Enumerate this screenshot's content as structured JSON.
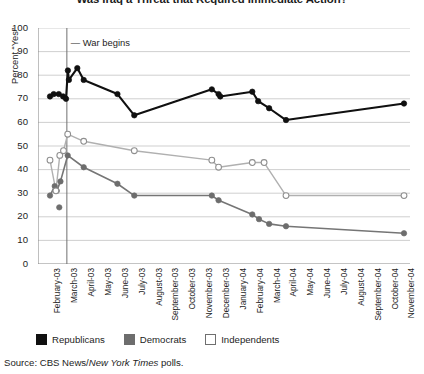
{
  "title": "Was Iraq a Threat that Required Immediate Action?",
  "source": {
    "prefix": "Source: CBS News/",
    "italic": "New York Times",
    "suffix": " polls."
  },
  "annotation": {
    "war_begins": "War begins",
    "war_begins_month": "March-03"
  },
  "axes": {
    "ylabel": "Percent “Yes”",
    "xlabel": "",
    "yticks": [
      0,
      10,
      20,
      30,
      40,
      50,
      60,
      70,
      80,
      90,
      100
    ],
    "ylim": [
      0,
      100
    ],
    "grid": "horizontal"
  },
  "legend": {
    "position": "below-plot",
    "entries": [
      {
        "label": "Republicans",
        "color": "#101010",
        "fill": "solid"
      },
      {
        "label": "Democrats",
        "color": "#6d6d6d",
        "fill": "solid"
      },
      {
        "label": "Independents",
        "color": "#ffffff",
        "fill": "open"
      }
    ]
  },
  "chart_data": {
    "type": "line",
    "title": "Was Iraq a Threat that Required Immediate Action?",
    "xlabel": "",
    "ylabel": "Percent “Yes”",
    "ylim": [
      0,
      100
    ],
    "grid": true,
    "legend_position": "below-plot",
    "categories": [
      "February-03",
      "March-03",
      "April-03",
      "May-03",
      "June-03",
      "July-03",
      "August-03",
      "September-03",
      "October-03",
      "November-03",
      "December-03",
      "January-04",
      "February-04",
      "March-04",
      "April-04",
      "May-04",
      "June-04",
      "July-04",
      "August-04",
      "September-04",
      "October-04",
      "November-04"
    ],
    "series": [
      {
        "name": "Republicans",
        "color": "#101010",
        "marker": "filled-circle",
        "points": [
          {
            "x": 0.0,
            "y": 71
          },
          {
            "x": 0.22,
            "y": 72
          },
          {
            "x": 0.52,
            "y": 72
          },
          {
            "x": 0.78,
            "y": 71
          },
          {
            "x": 0.95,
            "y": 70
          },
          {
            "x": 1.06,
            "y": 82
          },
          {
            "x": 1.12,
            "y": 78
          },
          {
            "x": 1.62,
            "y": 83
          },
          {
            "x": 2.0,
            "y": 78
          },
          {
            "x": 4.0,
            "y": 72
          },
          {
            "x": 5.0,
            "y": 63
          },
          {
            "x": 9.6,
            "y": 74
          },
          {
            "x": 10.0,
            "y": 72
          },
          {
            "x": 10.1,
            "y": 71
          },
          {
            "x": 12.0,
            "y": 73
          },
          {
            "x": 12.35,
            "y": 69
          },
          {
            "x": 13.0,
            "y": 66
          },
          {
            "x": 14.0,
            "y": 61
          },
          {
            "x": 21.0,
            "y": 68
          }
        ]
      },
      {
        "name": "Democrats",
        "color": "#6d6d6d",
        "marker": "filled-circle",
        "points": [
          {
            "x": 0.0,
            "y": 29
          },
          {
            "x": 0.28,
            "y": 33
          },
          {
            "x": 0.4,
            "y": 31
          },
          {
            "x": 0.62,
            "y": 35
          },
          {
            "x": 1.05,
            "y": 46
          },
          {
            "x": 2.0,
            "y": 41
          },
          {
            "x": 4.0,
            "y": 34
          },
          {
            "x": 5.0,
            "y": 29
          },
          {
            "x": 9.6,
            "y": 29
          },
          {
            "x": 10.0,
            "y": 27
          },
          {
            "x": 12.0,
            "y": 21
          },
          {
            "x": 12.4,
            "y": 19
          },
          {
            "x": 13.0,
            "y": 17
          },
          {
            "x": 14.0,
            "y": 16
          },
          {
            "x": 21.0,
            "y": 13
          }
        ],
        "outliers": [
          {
            "x": 0.55,
            "y": 24
          }
        ]
      },
      {
        "name": "Independents",
        "color": "#a8a8a8",
        "marker": "open-circle",
        "points": [
          {
            "x": 0.0,
            "y": 44
          },
          {
            "x": 0.35,
            "y": 31
          },
          {
            "x": 0.58,
            "y": 46
          },
          {
            "x": 0.8,
            "y": 48
          },
          {
            "x": 1.05,
            "y": 55
          },
          {
            "x": 2.0,
            "y": 52
          },
          {
            "x": 5.0,
            "y": 48
          },
          {
            "x": 9.6,
            "y": 44
          },
          {
            "x": 10.0,
            "y": 41
          },
          {
            "x": 12.0,
            "y": 43
          },
          {
            "x": 12.7,
            "y": 43
          },
          {
            "x": 14.0,
            "y": 29
          },
          {
            "x": 21.0,
            "y": 29
          }
        ]
      }
    ],
    "annotations": [
      {
        "text": "War begins",
        "type": "vline",
        "at_category": "March-03"
      }
    ]
  }
}
